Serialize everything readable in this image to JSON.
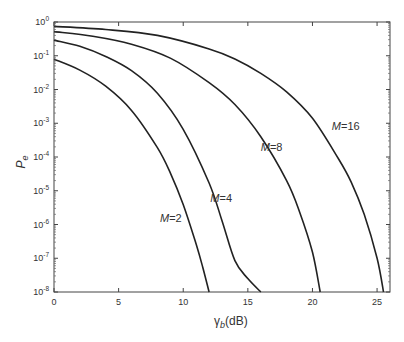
{
  "chart_data": {
    "type": "line",
    "title": "",
    "xlabel": "γb (dB)",
    "ylabel": "Pe",
    "xlim": [
      0,
      26
    ],
    "ylim": [
      1e-08,
      1
    ],
    "yscale": "log",
    "grid": false,
    "x_ticks": [
      0,
      5,
      10,
      15,
      20,
      25
    ],
    "y_ticks": [
      "10^0",
      "10^-1",
      "10^-2",
      "10^-3",
      "10^-4",
      "10^-5",
      "10^-6",
      "10^-7",
      "10^-8"
    ],
    "series": [
      {
        "name": "M=2",
        "label_pos": [
          8.2,
          1.2e-06
        ],
        "x": [
          0,
          2,
          4,
          6,
          8,
          9,
          10,
          11,
          11.5,
          12.0
        ],
        "values": [
          0.079,
          0.0375,
          0.0125,
          0.0024,
          0.00019,
          3.4e-05,
          3.9e-06,
          2.6e-07,
          5.6e-08,
          1e-08
        ]
      },
      {
        "name": "M=4",
        "label_pos": [
          12.1,
          4.5e-06
        ],
        "x": [
          0,
          2,
          4,
          6,
          8,
          10,
          12,
          13,
          14,
          15,
          16.0
        ],
        "values": [
          0.29,
          0.19,
          0.095,
          0.036,
          0.0077,
          0.00066,
          1.7e-05,
          1.3e-06,
          8.5e-08,
          2.5e-08,
          1e-08
        ]
      },
      {
        "name": "M=8",
        "label_pos": [
          16.0,
          0.00015
        ],
        "x": [
          0,
          3,
          6,
          9,
          12,
          14,
          16,
          18,
          19,
          20,
          20.6
        ],
        "values": [
          0.52,
          0.38,
          0.22,
          0.085,
          0.016,
          0.0036,
          0.0004,
          2e-05,
          2.4e-06,
          1.5e-07,
          1e-08
        ]
      },
      {
        "name": "M=16",
        "label_pos": [
          21.5,
          0.00065
        ],
        "x": [
          0,
          4,
          8,
          12,
          14,
          16,
          18,
          20,
          22,
          23,
          24,
          25,
          25.5
        ],
        "values": [
          0.74,
          0.6,
          0.4,
          0.16,
          0.08,
          0.03,
          0.0085,
          0.0014,
          9e-05,
          1.8e-05,
          2e-06,
          1e-07,
          1e-08
        ]
      }
    ]
  },
  "labels": {
    "x_axis": "γ",
    "x_axis_sub": "b",
    "x_axis_unit": "(dB)",
    "y_axis": "P",
    "y_axis_sub": "e"
  }
}
